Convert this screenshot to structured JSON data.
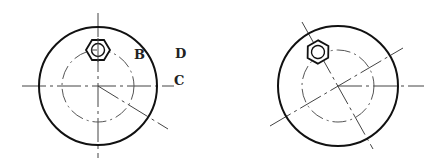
{
  "diagram": {
    "type": "mechanical-drawing",
    "colors": {
      "background": "#ffffff",
      "outline": "#111111",
      "centerline": "#444444"
    },
    "left_view": {
      "center": [
        98,
        86
      ],
      "outer_radius": 59,
      "bolt_circle_radius": 36,
      "nut_position": [
        98,
        50
      ],
      "labels": {
        "B": "B",
        "C": "C",
        "D": "D"
      }
    },
    "right_view": {
      "center": [
        338,
        86
      ],
      "outer_radius": 60,
      "bolt_circle_radius": 36,
      "nut_position": [
        318,
        52
      ],
      "rotation_deg": -30
    }
  }
}
